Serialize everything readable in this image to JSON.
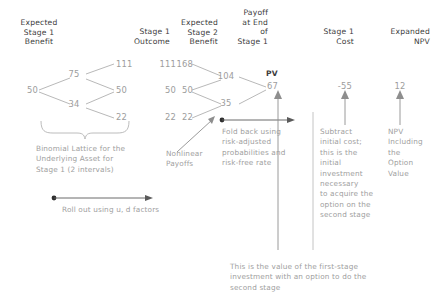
{
  "figure": {
    "type": "binomial-lattice-real-option-diagram",
    "accent_text": "#9d9d9d",
    "header_text": "#3c3c3c"
  },
  "headers": {
    "expected_stage1_benefit": "Expected\nStage 1\nBenefit",
    "stage1_outcome": "Stage 1\nOutcome",
    "expected_stage2_benefit": "Expected\nStage 2\nBenefit",
    "payoff_end_stage1": "Payoff\nat End\nof\nStage 1",
    "stage1_cost": "Stage 1\nCost",
    "expanded_npv": "Expanded\nNPV"
  },
  "lattice": {
    "root": "50",
    "up1": "75",
    "down1": "34",
    "uu": "111",
    "ud": "50",
    "dd": "22"
  },
  "stage2_benefit": {
    "uu": "111",
    "ud": "50",
    "dd": "22"
  },
  "payoff": {
    "uu": "168",
    "ud": "50",
    "dd": "22"
  },
  "foldback": {
    "up": "104",
    "down": "35",
    "pv_label": "PV",
    "pv_value": "67"
  },
  "cost": {
    "value": "-55"
  },
  "npv": {
    "value": "12"
  },
  "notes": {
    "binomial_lattice": "Binomial Lattice for the\nUnderlying Asset for\nStage 1 (2 intervals)",
    "roll_out": "Roll out using u, d factors",
    "nonlinear_payoffs": "Nonlinear\nPayoffs",
    "fold_back": "Fold back using\nrisk-adjusted\nprobabilities and\nrisk-free rate",
    "subtract_cost": "Subtract\ninitial cost;\nthis is the\ninitial\ninvestment\nnecessary\nto acquire the\noption on the\nsecond stage",
    "npv_including": "NPV\nIncluding\nthe\nOption\nValue",
    "first_stage_value": "This is the value of the first-stage\ninvestment with an option to do the\nsecond stage"
  }
}
